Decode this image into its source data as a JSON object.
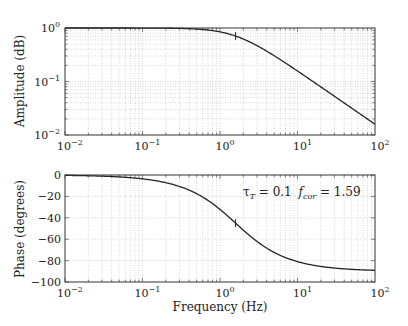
{
  "chart_data": [
    {
      "type": "line",
      "title": "",
      "xlabel": "",
      "ylabel": "Amplitude (dB)",
      "xscale": "log",
      "yscale": "log",
      "xlim": [
        0.01,
        100
      ],
      "ylim": [
        0.01,
        1
      ],
      "grid": true,
      "x_ticks": [
        "10^-2",
        "10^-1",
        "10^0",
        "10^1",
        "10^2"
      ],
      "y_ticks": [
        "10^-2",
        "10^-1",
        "10^0"
      ],
      "series": [
        {
          "name": "amplitude",
          "formula": "1/sqrt(1+(f/1.59)^2)",
          "x": [
            0.01,
            0.1,
            0.5,
            1,
            1.59,
            3,
            10,
            30,
            100
          ],
          "values": [
            1.0,
            0.998,
            0.954,
            0.847,
            0.707,
            0.468,
            0.157,
            0.053,
            0.016
          ]
        }
      ],
      "markers": [
        {
          "x": 1.59,
          "y": 0.707
        }
      ]
    },
    {
      "type": "line",
      "title": "",
      "xlabel": "Frequency (Hz)",
      "ylabel": "Phase (degrees)",
      "xscale": "log",
      "xlim": [
        0.01,
        100
      ],
      "ylim": [
        -100,
        0
      ],
      "grid": true,
      "x_ticks": [
        "10^-2",
        "10^-1",
        "10^0",
        "10^1",
        "10^2"
      ],
      "y_ticks": [
        "0",
        "-20",
        "-40",
        "-60",
        "-80",
        "-100"
      ],
      "series": [
        {
          "name": "phase",
          "formula": "-atan(f/1.59)",
          "x": [
            0.01,
            0.1,
            0.5,
            1,
            1.59,
            3,
            10,
            30,
            100
          ],
          "values": [
            -0.4,
            -3.6,
            -17.5,
            -32.2,
            -45.0,
            -62.1,
            -81.0,
            -87.0,
            -89.1
          ]
        }
      ],
      "markers": [
        {
          "x": 1.59,
          "y": -45
        }
      ],
      "annotations": [
        {
          "text": "τ_T = 0.1  f_cor = 1.59"
        }
      ]
    }
  ],
  "labels": {
    "amp_ylabel": "Amplitude (dB)",
    "phase_ylabel": "Phase (degrees)",
    "xlabel": "Frequency (Hz)",
    "tau_symbol": "τ",
    "tau_sub": "T",
    "tau_value": " = 0.1 ",
    "fcor_symbol": "f",
    "fcor_sub": "cor",
    "fcor_value": " = 1.59"
  },
  "params": {
    "fc": 1.59
  },
  "colors": {
    "line": "#222222",
    "grid": "#bdbdbd",
    "axis": "#333333"
  }
}
